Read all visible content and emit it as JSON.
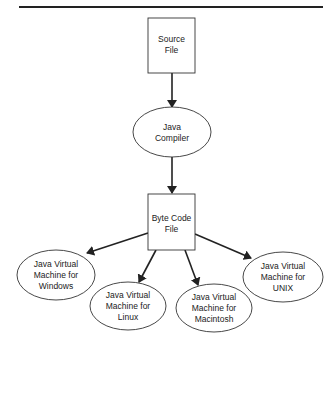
{
  "header": {
    "cutoff_text": "Figure 1-1: Java compilation process"
  },
  "diagram": {
    "nodes": [
      {
        "id": "source",
        "shape": "rect",
        "lines": [
          "Source",
          "File"
        ]
      },
      {
        "id": "compiler",
        "shape": "ellipse",
        "lines": [
          "Java",
          "Compiler"
        ]
      },
      {
        "id": "bytecode",
        "shape": "rect",
        "lines": [
          "Byte Code",
          "File"
        ]
      },
      {
        "id": "jvm_windows",
        "shape": "ellipse",
        "lines": [
          "Java Virtual",
          "Machine for",
          "Windows"
        ]
      },
      {
        "id": "jvm_linux",
        "shape": "ellipse",
        "lines": [
          "Java Virtual",
          "Machine for",
          "Linux"
        ]
      },
      {
        "id": "jvm_mac",
        "shape": "ellipse",
        "lines": [
          "Java Virtual",
          "Machine for",
          "Macintosh"
        ]
      },
      {
        "id": "jvm_unix",
        "shape": "ellipse",
        "lines": [
          "Java Virtual",
          "Machine for",
          "UNIX"
        ]
      }
    ],
    "edges": [
      {
        "from": "source",
        "to": "compiler"
      },
      {
        "from": "compiler",
        "to": "bytecode"
      },
      {
        "from": "bytecode",
        "to": "jvm_windows"
      },
      {
        "from": "bytecode",
        "to": "jvm_linux"
      },
      {
        "from": "bytecode",
        "to": "jvm_mac"
      },
      {
        "from": "bytecode",
        "to": "jvm_unix"
      }
    ],
    "colors": {
      "stroke": "#222222",
      "fill": "#ffffff",
      "text": "#222222"
    }
  }
}
